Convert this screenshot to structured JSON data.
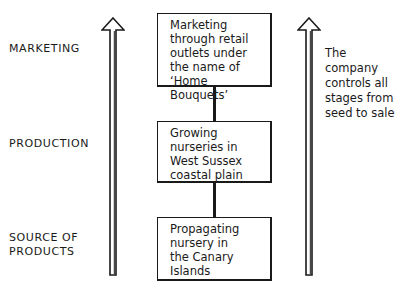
{
  "levels": [
    {
      "label": "MARKETING"
    },
    {
      "label": "PRODUCTION"
    },
    {
      "label": "SOURCE OF\nPRODUCTS"
    }
  ],
  "boxes": [
    {
      "text": "Marketing\nthrough retail\noutlets under\nthe name of\n‘Home Bouquets’"
    },
    {
      "text": "Growing\nnurseries in\nWest Sussex\ncoastal plain"
    },
    {
      "text": "Propagating\nnursery in\nthe Canary\nIslands"
    }
  ],
  "note": {
    "text": "The company\ncontrols all\nstages from\nseed to sale"
  },
  "arrows": [
    {
      "name": "left-arrow-up",
      "direction": "up"
    },
    {
      "name": "right-arrow-up",
      "direction": "up"
    }
  ]
}
